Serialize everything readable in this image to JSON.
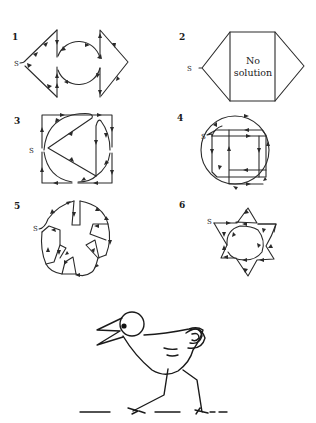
{
  "puzzles": [
    {
      "number": "1",
      "start_label": "S",
      "note": ""
    },
    {
      "number": "2",
      "start_label": "S",
      "note_line1": "No",
      "note_line2": "solution"
    },
    {
      "number": "3",
      "start_label": "S",
      "note": ""
    },
    {
      "number": "4",
      "start_label": "S",
      "note": ""
    },
    {
      "number": "5",
      "start_label": "S",
      "note": ""
    },
    {
      "number": "6",
      "start_label": "S",
      "note": ""
    }
  ],
  "illustration": {
    "subject": "cartoon bird walking on dashed ground line"
  },
  "colors": {
    "ink": "#2a2a2a",
    "background": "#ffffff"
  }
}
